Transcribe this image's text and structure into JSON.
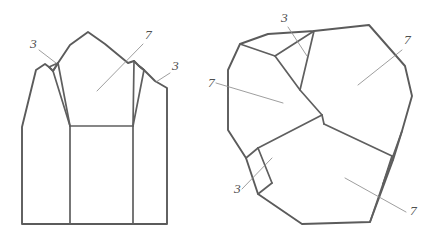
{
  "figure": {
    "background_color": "#ffffff",
    "stroke_color": "#5b5b5b",
    "leader_color": "#8d8d8d",
    "numeral_color": "#4f4f4f"
  },
  "views": {
    "left": {
      "name": "side-elevation-view",
      "callouts": [
        {
          "id": "left-3-top",
          "label": "3",
          "x": 30,
          "y": 48,
          "leader": "M 39,50 L 56,63"
        },
        {
          "id": "left-7",
          "label": "7",
          "x": 145,
          "y": 39,
          "leader": "M 143,44 L 97,91"
        },
        {
          "id": "left-3-right",
          "label": "3",
          "x": 172,
          "y": 70,
          "leader": "M 170,73 L 156,82"
        }
      ],
      "outline": "M 22,224 L 22,127 L 36,70 L 45,64 L 49,67 L 53,71 L 58,63 L 70,45 L 88,32 L 105,44 L 128,63 L 134,61 L 139,66 L 144,70 L 155,81 L 167,88 L 167,224 Z",
      "edges": [
        "M 49,67 L 58,63",
        "M 49,67 L 53,71 L 58,63",
        "M 53,71 L 70,126",
        "M 58,63 L 70,126",
        "M 70,126 L 70,224",
        "M 70,126 L 133,126",
        "M 133,126 L 133,224",
        "M 133,126 L 144,70",
        "M 139,66 L 144,70",
        "M 134,61 L 139,66 L 144,70",
        "M 134,61 L 133,126"
      ]
    },
    "right": {
      "name": "plan-view",
      "callouts": [
        {
          "id": "right-3-top",
          "label": "3",
          "x": 281,
          "y": 22,
          "leader": "M 288,27 L 307,56"
        },
        {
          "id": "right-7-left",
          "label": "7",
          "x": 208,
          "y": 87,
          "leader": "M 216,83 L 283,103"
        },
        {
          "id": "right-7-top-right",
          "label": "7",
          "x": 404,
          "y": 44,
          "leader": "M 402,50 L 358,85"
        },
        {
          "id": "right-3-bottom",
          "label": "3",
          "x": 234,
          "y": 193,
          "leader": "M 242,189 L 272,158"
        },
        {
          "id": "right-7-bottom",
          "label": "7",
          "x": 410,
          "y": 215,
          "leader": "M 406,212 L 345,178"
        }
      ],
      "outline": "M 240,44 L 268,34 L 314,31 L 369,25 L 405,66 L 412,96 L 402,131 L 393,160 L 370,222 L 302,224 L 258,194 L 246,158 L 228,130 L 228,70 Z",
      "edges": [
        "M 240,44 L 275,56 L 300,90 L 322,115",
        "M 275,56 L 314,31",
        "M 300,90 L 314,31",
        "M 322,115 L 324,124",
        "M 322,115 L 258,148",
        "M 258,148 L 246,158",
        "M 258,148 L 272,183",
        "M 272,183 L 258,194",
        "M 324,124 L 392,156",
        "M 392,156 L 393,160",
        "M 392,156 L 383,184",
        "M 383,184 L 370,222",
        "M 383,184 L 402,131"
      ]
    }
  }
}
